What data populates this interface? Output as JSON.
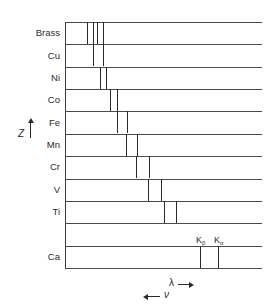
{
  "diagram": {
    "type": "x-ray-emission-line-chart",
    "axis_z": {
      "label": "Z",
      "direction": "up"
    },
    "axis_lambda": {
      "label": "λ",
      "direction": "right"
    },
    "axis_nu": {
      "label": "ν",
      "direction": "left"
    },
    "rows": [
      {
        "label": "Brass",
        "lines_x": [
          87,
          93,
          97,
          103
        ]
      },
      {
        "label": "Cu",
        "lines_x": [
          93,
          103
        ]
      },
      {
        "label": "Ni",
        "lines_x": [
          100,
          106
        ]
      },
      {
        "label": "Co",
        "lines_x": [
          110,
          117
        ]
      },
      {
        "label": "Fe",
        "lines_x": [
          117,
          127
        ]
      },
      {
        "label": "Mn",
        "lines_x": [
          126,
          137
        ]
      },
      {
        "label": "Cr",
        "lines_x": [
          136,
          149
        ]
      },
      {
        "label": "V",
        "lines_x": [
          148,
          161
        ]
      },
      {
        "label": "Ti",
        "lines_x": [
          164,
          176
        ]
      },
      {
        "label": "",
        "lines_x": []
      },
      {
        "label": "Ca",
        "lines_x": [
          200,
          218
        ]
      }
    ],
    "line_labels": {
      "k_beta": {
        "main": "K",
        "sub": "β"
      },
      "k_alpha": {
        "main": "K",
        "sub": "α"
      }
    }
  }
}
